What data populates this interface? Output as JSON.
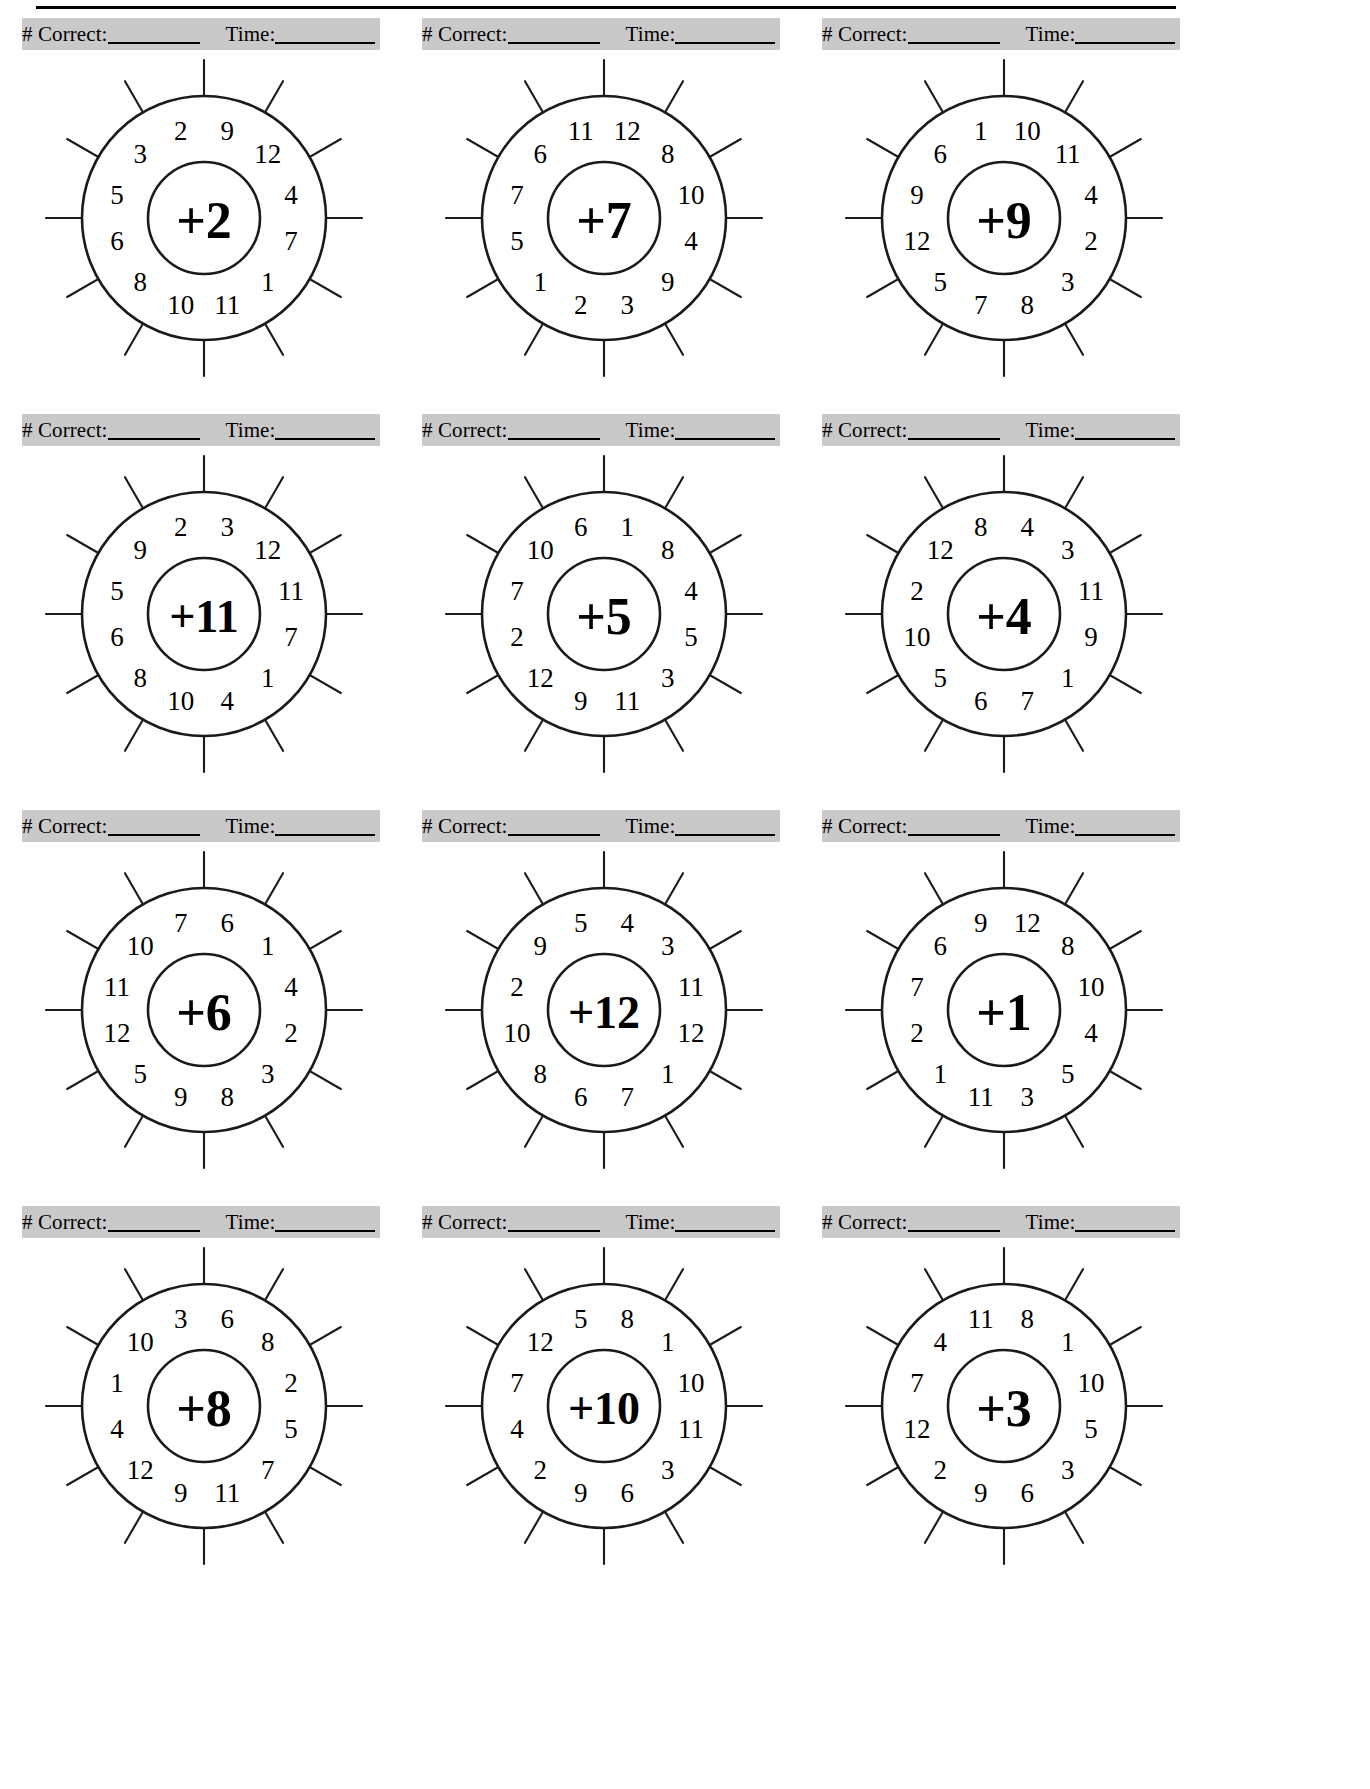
{
  "worksheet": {
    "title_rule": true,
    "score_label_correct": "# Correct:",
    "score_label_time": "Time:",
    "wheel_geometry": {
      "sectors": 12,
      "outer_radius": 122,
      "inner_radius": 56,
      "spoke_overhang": 36,
      "label_radius": 90
    },
    "colors": {
      "scorebar_gray": "#c9c9c9",
      "ink": "#1a1a1a",
      "paper": "#ffffff"
    }
  },
  "wheels": [
    {
      "id": "wheel-plus-2",
      "operator": "+2",
      "sector_numbers": [
        "9",
        "12",
        "4",
        "7",
        "1",
        "11",
        "10",
        "8",
        "6",
        "5",
        "3",
        "2"
      ]
    },
    {
      "id": "wheel-plus-7",
      "operator": "+7",
      "sector_numbers": [
        "12",
        "8",
        "10",
        "4",
        "9",
        "3",
        "2",
        "1",
        "5",
        "7",
        "6",
        "11"
      ]
    },
    {
      "id": "wheel-plus-9",
      "operator": "+9",
      "sector_numbers": [
        "10",
        "11",
        "4",
        "2",
        "3",
        "8",
        "7",
        "5",
        "12",
        "9",
        "6",
        "1"
      ]
    },
    {
      "id": "wheel-plus-11",
      "operator": "+11",
      "sector_numbers": [
        "3",
        "12",
        "11",
        "7",
        "1",
        "4",
        "10",
        "8",
        "6",
        "5",
        "9",
        "2"
      ]
    },
    {
      "id": "wheel-plus-5",
      "operator": "+5",
      "sector_numbers": [
        "1",
        "8",
        "4",
        "5",
        "3",
        "11",
        "9",
        "12",
        "2",
        "7",
        "10",
        "6"
      ]
    },
    {
      "id": "wheel-plus-4",
      "operator": "+4",
      "sector_numbers": [
        "4",
        "3",
        "11",
        "9",
        "1",
        "7",
        "6",
        "5",
        "10",
        "2",
        "12",
        "8"
      ]
    },
    {
      "id": "wheel-plus-6",
      "operator": "+6",
      "sector_numbers": [
        "6",
        "1",
        "4",
        "2",
        "3",
        "8",
        "9",
        "5",
        "12",
        "11",
        "10",
        "7"
      ]
    },
    {
      "id": "wheel-plus-12",
      "operator": "+12",
      "sector_numbers": [
        "4",
        "3",
        "11",
        "12",
        "1",
        "7",
        "6",
        "8",
        "10",
        "2",
        "9",
        "5"
      ]
    },
    {
      "id": "wheel-plus-1",
      "operator": "+1",
      "sector_numbers": [
        "12",
        "8",
        "10",
        "4",
        "5",
        "3",
        "11",
        "1",
        "2",
        "7",
        "6",
        "9"
      ]
    },
    {
      "id": "wheel-plus-8",
      "operator": "+8",
      "sector_numbers": [
        "6",
        "8",
        "2",
        "5",
        "7",
        "11",
        "9",
        "12",
        "4",
        "1",
        "10",
        "3"
      ]
    },
    {
      "id": "wheel-plus-10",
      "operator": "+10",
      "sector_numbers": [
        "8",
        "1",
        "10",
        "11",
        "3",
        "6",
        "9",
        "2",
        "4",
        "7",
        "12",
        "5"
      ]
    },
    {
      "id": "wheel-plus-3",
      "operator": "+3",
      "sector_numbers": [
        "8",
        "1",
        "10",
        "5",
        "3",
        "6",
        "9",
        "2",
        "12",
        "7",
        "4",
        "11"
      ]
    }
  ]
}
